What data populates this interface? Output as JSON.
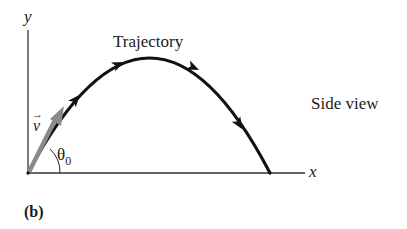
{
  "diagram": {
    "axes": {
      "y_label": "y",
      "x_label": "x"
    },
    "labels": {
      "trajectory": "Trajectory",
      "side_view": "Side view",
      "velocity": "v",
      "velocity_arrow": "→",
      "angle": "θ",
      "angle_subscript": "0",
      "panel": "(b)"
    },
    "colors": {
      "trajectory": "#111111",
      "velocity_vector": "#8a8a8a",
      "axes": "#333333"
    },
    "geometry": {
      "origin": [
        28,
        173
      ],
      "peak": [
        150,
        58
      ],
      "landing": [
        270,
        173
      ],
      "velocity_tip": [
        64,
        106
      ]
    }
  }
}
